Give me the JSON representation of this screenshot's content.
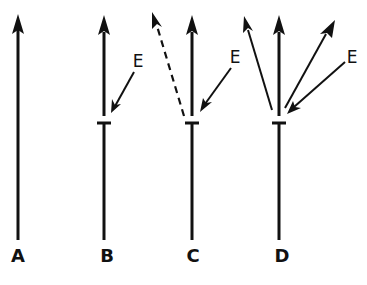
{
  "diagram": {
    "panels": [
      {
        "label": "A",
        "description": "single straight arrow, no branching"
      },
      {
        "label": "B",
        "description": "arrow with T-bar and event E arrow pointing at junction"
      },
      {
        "label": "C",
        "description": "T-bar with event E and one dashed branch arrow"
      },
      {
        "label": "D",
        "description": "T-bar with event E and multiple solid branch arrows"
      }
    ],
    "event_label": "E",
    "colors": {
      "stroke": "#111111",
      "background": "#ffffff"
    }
  }
}
